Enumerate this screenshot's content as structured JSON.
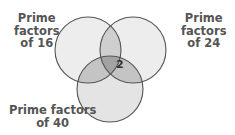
{
  "diagram": {
    "type": "venn",
    "sets": [
      {
        "label_line1": "Prime",
        "label_line2": "factors",
        "label_line3": "of 16"
      },
      {
        "label_line1": "Prime",
        "label_line2": "factors",
        "label_line3": "of 24"
      },
      {
        "label_line1": "Prime factors",
        "label_line2": "of 40"
      }
    ],
    "center_value": "2",
    "colors": {
      "stroke": "#555555",
      "fill_single": "#ececec",
      "fill_double": "#c8c8c8",
      "fill_triple": "#a0a0a0"
    }
  }
}
